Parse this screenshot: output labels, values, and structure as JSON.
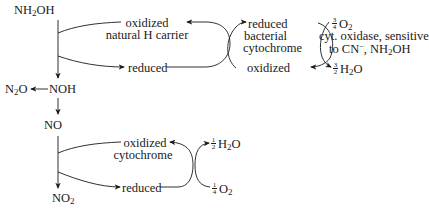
{
  "diagram": {
    "type": "biochemical-pathway",
    "colors": {
      "ink": "#1a1a1a",
      "background": "#ffffff"
    },
    "main_chain": [
      {
        "id": "nh2oh",
        "base": "NH",
        "sub": "2",
        "rest": "OH"
      },
      {
        "id": "noh",
        "label": "NOH"
      },
      {
        "id": "no",
        "label": "NO"
      },
      {
        "id": "no2",
        "base": "NO",
        "sub": "2"
      }
    ],
    "side_product": {
      "base": "N",
      "sub": "2",
      "rest": "O"
    },
    "upper_cycle": {
      "carrier_oxidized": "oxidized",
      "carrier_name": "natural H carrier",
      "carrier_reduced": "reduced",
      "cyt_reduced": "reduced",
      "cyt_line2": "bacterial",
      "cyt_line3": "cytochrome",
      "cyt_oxidized": "oxidized",
      "o2": {
        "num": "3",
        "den": "4",
        "base": "O",
        "sub": "2"
      },
      "h2o": {
        "num": "3",
        "den": "2",
        "base": "H",
        "sub": "2",
        "rest": "O"
      },
      "enzyme_line1": "cyt. oxidase, sensitive",
      "enzyme_line2_a": "to CN",
      "enzyme_line2_sup": "−",
      "enzyme_line2_b": ", NH",
      "enzyme_line2_sub": "2",
      "enzyme_line2_c": "OH"
    },
    "lower_cycle": {
      "cyt_oxidized": "oxidized",
      "cyt_name": "cytochrome",
      "cyt_reduced": "reduced",
      "h2o": {
        "num": "1",
        "den": "2",
        "base": "H",
        "sub": "2",
        "rest": "O"
      },
      "o2": {
        "num": "1",
        "den": "4",
        "base": "O",
        "sub": "2"
      }
    }
  }
}
